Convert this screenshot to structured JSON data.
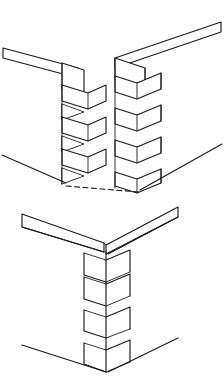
{
  "figure": {
    "title": "Corner box joint (finger joint) — exploded and assembled views",
    "caption": "",
    "background_color": "#ffffff",
    "line_color": "#1a1a1a",
    "views": [
      {
        "name": "exploded-view",
        "label": "Exploded view",
        "description": "Two boards meeting at a right-angle corner shown pulled apart, revealing interlocking square fingers on each mating edge.",
        "parts": [
          {
            "name": "left-board",
            "label": "Left board",
            "finger_count": 4,
            "edge_orientation": "receding-left"
          },
          {
            "name": "right-board",
            "label": "Right board",
            "finger_count": 4,
            "edge_orientation": "receding-right"
          }
        ],
        "guide_lines": [
          {
            "name": "ground-guide-left",
            "style": "solid"
          },
          {
            "name": "ground-guide-right",
            "style": "solid"
          },
          {
            "name": "alignment-guide",
            "style": "dashed"
          }
        ]
      },
      {
        "name": "assembled-view",
        "label": "Assembled view",
        "description": "The same corner joint closed up, with the fingers fully seated and the corner arris running vertically down the middle.",
        "parts": [
          {
            "name": "left-board",
            "label": "Left board",
            "finger_count": 4,
            "edge_orientation": "receding-left"
          },
          {
            "name": "right-board",
            "label": "Right board",
            "finger_count": 4,
            "edge_orientation": "receding-right"
          }
        ],
        "guide_lines": [
          {
            "name": "ground-guide-left",
            "style": "solid"
          },
          {
            "name": "ground-guide-right",
            "style": "solid"
          }
        ]
      }
    ]
  }
}
